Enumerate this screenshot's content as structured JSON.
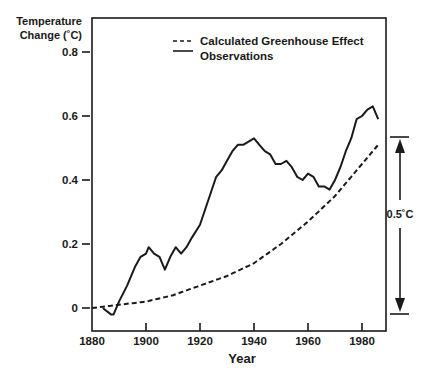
{
  "chart_data": {
    "type": "line",
    "title": "",
    "xlabel": "Year",
    "ylabel": "Temperature Change (˚C)",
    "ylabel_lines": [
      "Temperature",
      "Change (˚C)"
    ],
    "xlim": [
      1880,
      1992
    ],
    "ylim": [
      -0.07,
      0.9
    ],
    "xticks": [
      1880,
      1900,
      1920,
      1940,
      1960,
      1980
    ],
    "xtick_labels": [
      "1880",
      "1900",
      "1920",
      "1940",
      "1960",
      "1980"
    ],
    "yticks": [
      0,
      0.2,
      0.4,
      0.6,
      0.8
    ],
    "ytick_labels": [
      "0",
      "0.2",
      "0.4",
      "0.6",
      "0.8"
    ],
    "grid": false,
    "legend_position": "upper-left-inside",
    "legend": [
      {
        "label": "Calculated Greenhouse Effect",
        "style": "dashed"
      },
      {
        "label": "Observations",
        "style": "solid"
      }
    ],
    "annotations": [
      {
        "text": "0.5˚C",
        "type": "double-arrow-bracket",
        "from": 0.0,
        "to": 0.5,
        "position": "right-outside"
      }
    ],
    "series": [
      {
        "name": "Observations",
        "style": "solid",
        "x": [
          1884,
          1887,
          1888,
          1890,
          1893,
          1896,
          1898,
          1900,
          1901,
          1903,
          1905,
          1907,
          1909,
          1911,
          1913,
          1915,
          1917,
          1920,
          1922,
          1924,
          1926,
          1928,
          1930,
          1932,
          1934,
          1936,
          1938,
          1940,
          1942,
          1944,
          1946,
          1948,
          1950,
          1952,
          1954,
          1956,
          1958,
          1960,
          1962,
          1964,
          1966,
          1968,
          1970,
          1972,
          1974,
          1976,
          1978,
          1980,
          1982,
          1984,
          1986
        ],
        "values": [
          0.0,
          -0.02,
          -0.02,
          0.02,
          0.07,
          0.13,
          0.16,
          0.17,
          0.19,
          0.17,
          0.16,
          0.12,
          0.16,
          0.19,
          0.17,
          0.19,
          0.22,
          0.26,
          0.31,
          0.36,
          0.41,
          0.43,
          0.46,
          0.49,
          0.51,
          0.51,
          0.52,
          0.53,
          0.51,
          0.49,
          0.48,
          0.45,
          0.45,
          0.46,
          0.44,
          0.41,
          0.4,
          0.42,
          0.41,
          0.38,
          0.38,
          0.37,
          0.4,
          0.44,
          0.49,
          0.53,
          0.59,
          0.6,
          0.62,
          0.63,
          0.59
        ]
      },
      {
        "name": "Calculated Greenhouse Effect",
        "style": "dashed",
        "x": [
          1880,
          1890,
          1900,
          1910,
          1920,
          1930,
          1940,
          1950,
          1960,
          1970,
          1980,
          1986
        ],
        "values": [
          0.0,
          0.01,
          0.02,
          0.04,
          0.07,
          0.1,
          0.14,
          0.2,
          0.27,
          0.35,
          0.45,
          0.51
        ]
      }
    ]
  },
  "legend": {
    "calculated_label": "Calculated Greenhouse Effect",
    "observations_label": "Observations"
  },
  "axes": {
    "y_title_line1": "Temperature",
    "y_title_line2": "Change (˚C)",
    "x_title": "Year"
  },
  "annotation": {
    "bracket_label": "0.5˚C"
  },
  "colors": {
    "line": "#111111",
    "background": "#ffffff"
  }
}
